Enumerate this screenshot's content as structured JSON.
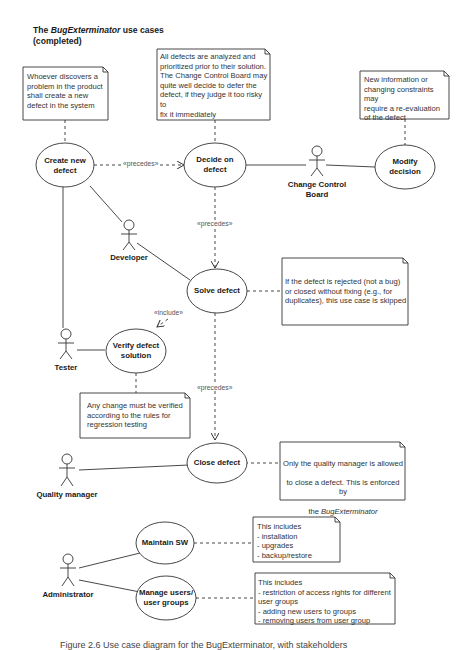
{
  "title": {
    "prefix": "The ",
    "italic": "BugExterminator",
    "suffix": " use cases",
    "line2": "(completed)"
  },
  "notes": {
    "create": "Whoever discovers a\nproblem in the product\nshall create a new\ndefect in the system",
    "decide": "All defects are analyzed and\nprioritized prior to their solution.\nThe Change Control Board may\nquite well decide to defer the\ndefect, if they judge it too risky to\nfix it immediately",
    "modify": "New information or\nchanging constraints may\nrequire a re-evaluation\nof the defect",
    "solve": "If the defect is rejected (not a bug)\nor closed without fixing (e.g., for\nduplicates), this use case is skipped",
    "verify": "Any change must be verified\naccording to the rules for\nregression testing",
    "close_line1": "Only the quality manager is allowed",
    "close_line2": "to close a defect. This is enforced by",
    "close_line3": "BugExterminator",
    "close_line3_prefix": "the ",
    "maintain": "This includes\n- installation\n- upgrades\n- backup/restore",
    "manage": "This includes\n- restriction of access rights for different\nuser groups\n- adding new users to groups\n- removing users from user group"
  },
  "use_cases": {
    "create": "Create new\ndefect",
    "decide": "Decide on\ndefect",
    "modify": "Modify\ndecision",
    "solve": "Solve defect",
    "verify": "Verify defect\nsolution",
    "close": "Close defect",
    "maintain": "Maintain SW",
    "manage": "Manage users/\nuser groups"
  },
  "actors": {
    "ccb": "Change Control\nBoard",
    "developer": "Developer",
    "tester": "Tester",
    "quality": "Quality manager",
    "admin": "Administrator"
  },
  "relations": {
    "precedes_1": "«precedes»",
    "precedes_2": "«precedes»",
    "precedes_3": "«precedes»",
    "include": "«include»"
  },
  "caption": "Figure 2.6 Use case diagram for the BugExterminator, with stakeholders"
}
